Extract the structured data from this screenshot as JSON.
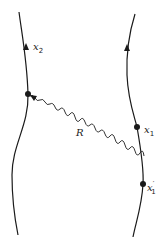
{
  "diagram": {
    "worldlines": [
      {
        "name": "left-worldline",
        "arrow_label": "x",
        "arrow_sub": "2"
      },
      {
        "name": "right-worldline"
      }
    ],
    "points": [
      {
        "id": "x2-point",
        "label": "",
        "sub": ""
      },
      {
        "id": "x1-point",
        "label": "x",
        "sub": "1"
      },
      {
        "id": "x1prime-point",
        "label": "x",
        "prime": "′",
        "sub": "1"
      }
    ],
    "propagator": {
      "label": "R"
    },
    "colors": {
      "stroke": "#1a1a1a",
      "background": "#ffffff"
    }
  }
}
